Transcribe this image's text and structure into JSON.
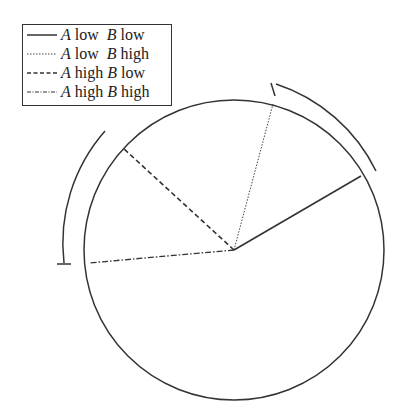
{
  "legend": {
    "items": [
      {
        "a": "A",
        "a_level": "low",
        "b": "B",
        "b_level": "low",
        "style": "solid"
      },
      {
        "a": "A",
        "a_level": "low",
        "b": "B",
        "b_level": "high",
        "style": "dotted"
      },
      {
        "a": "A",
        "a_level": "high",
        "b": "B",
        "b_level": "low",
        "style": "dashed"
      },
      {
        "a": "A",
        "a_level": "high",
        "b": "B",
        "b_level": "high",
        "style": "dash-dot"
      }
    ]
  },
  "diagram": {
    "type": "circular-direction-plot",
    "circle": {
      "cx": 234,
      "cy": 250,
      "r": 150
    },
    "stroke_color": "#333333",
    "radii": [
      {
        "name": "A low B low",
        "style": "solid",
        "end": [
          361,
          176
        ]
      },
      {
        "name": "A low B high",
        "style": "dotted",
        "end": [
          273,
          104
        ]
      },
      {
        "name": "A high B low",
        "style": "dashed",
        "end": [
          123,
          148
        ]
      },
      {
        "name": "A high B high",
        "style": "dash-dot",
        "end": [
          89,
          263
        ]
      }
    ],
    "outer_arcs": [
      {
        "side": "right",
        "r": 170,
        "from_deg": -77,
        "to_deg": -35,
        "tick_end": "start"
      },
      {
        "side": "left",
        "r": 170,
        "from_deg": -138,
        "to_deg": -184,
        "tick_end": "end"
      }
    ]
  }
}
